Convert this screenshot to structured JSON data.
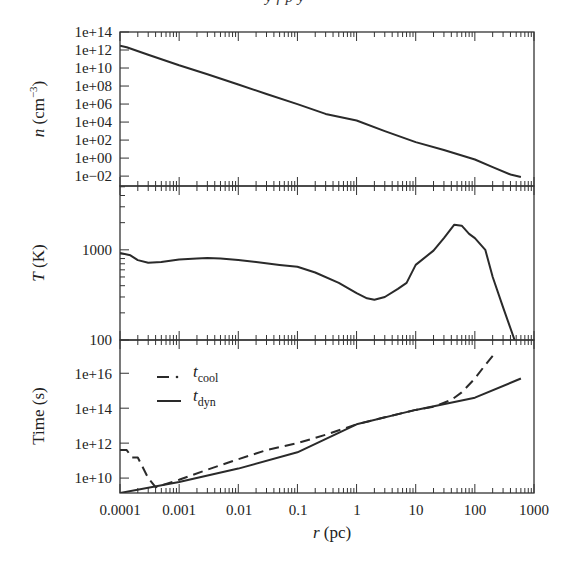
{
  "header": {
    "clipped_text": "y f p y"
  },
  "layout": {
    "plot_left": 120,
    "plot_right": 534,
    "panels": [
      {
        "id": "density",
        "top": 32,
        "bottom": 186
      },
      {
        "id": "temperature",
        "top": 186,
        "bottom": 340
      },
      {
        "id": "time",
        "top": 340,
        "bottom": 493
      }
    ]
  },
  "colors": {
    "line": "#2a2a2a",
    "axis": "#333333",
    "background": "#ffffff"
  },
  "chart_data": [
    {
      "type": "line",
      "title": "",
      "xlabel": "r (pc)",
      "ylabel": "n (cm^-3)",
      "xscale": "log",
      "yscale": "log",
      "xlim": [
        0.0001,
        1000
      ],
      "ylim": [
        0.0008,
        100000000000000.0
      ],
      "ytick_labels": [
        "1e+14",
        "1e+12",
        "1e+10",
        "1e+08",
        "1e+06",
        "1e+04",
        "1e+02",
        "1e+00",
        "1e-02"
      ],
      "ytick_values": [
        100000000000000.0,
        1000000000000.0,
        10000000000.0,
        100000000.0,
        1000000.0,
        10000.0,
        100.0,
        1,
        0.01
      ],
      "grid": false,
      "series": [
        {
          "name": "n",
          "style": "solid",
          "x": [
            0.0001,
            0.00013,
            0.0003,
            0.001,
            0.003,
            0.01,
            0.03,
            0.1,
            0.3,
            1,
            3,
            10,
            30,
            100,
            200,
            400,
            600
          ],
          "y": [
            3000000000000.0,
            2000000000000.0,
            300000000000.0,
            20000000000.0,
            2000000000.0,
            150000000.0,
            13000000.0,
            1000000.0,
            80000.0,
            15000.0,
            1000.0,
            60,
            8,
            0.7,
            0.1,
            0.015,
            0.008
          ]
        }
      ]
    },
    {
      "type": "line",
      "xlabel": "r (pc)",
      "ylabel": "T (K)",
      "xscale": "log",
      "yscale": "log",
      "xlim": [
        0.0001,
        1000
      ],
      "ylim": [
        100,
        5100
      ],
      "ytick_labels": [
        "1000",
        "100"
      ],
      "ytick_values": [
        1000,
        100
      ],
      "grid": false,
      "series": [
        {
          "name": "T",
          "style": "solid",
          "x": [
            0.0001,
            0.00015,
            0.0002,
            0.0003,
            0.0005,
            0.001,
            0.002,
            0.003,
            0.005,
            0.01,
            0.02,
            0.05,
            0.1,
            0.2,
            0.5,
            1,
            1.5,
            2,
            3,
            5,
            7,
            10,
            20,
            30,
            45,
            60,
            80,
            100,
            150,
            200,
            300,
            470
          ],
          "y": [
            920,
            870,
            770,
            720,
            730,
            780,
            800,
            810,
            800,
            770,
            730,
            680,
            650,
            560,
            430,
            330,
            290,
            280,
            300,
            370,
            430,
            680,
            980,
            1350,
            1900,
            1850,
            1500,
            1350,
            1000,
            500,
            230,
            100
          ]
        }
      ]
    },
    {
      "type": "line",
      "xlabel": "r (pc)",
      "ylabel": "Time (s)",
      "xscale": "log",
      "yscale": "log",
      "xlim": [
        0.0001,
        1000
      ],
      "ylim": [
        1400000000.0,
        8e+17
      ],
      "ytick_labels": [
        "1e+16",
        "1e+14",
        "1e+12",
        "1e+10"
      ],
      "ytick_values": [
        1e+16,
        100000000000000.0,
        1000000000000.0,
        10000000000.0
      ],
      "xtick_labels": [
        "0.0001",
        "0.001",
        "0.01",
        "0.1",
        "1",
        "10",
        "100",
        "1000"
      ],
      "xtick_values": [
        0.0001,
        0.001,
        0.01,
        0.1,
        1,
        10,
        100,
        1000
      ],
      "legend": {
        "position": "upper left",
        "entries": [
          {
            "label": "t",
            "subscript": "cool",
            "style": "dash-dot"
          },
          {
            "label": "t",
            "subscript": "dyn",
            "style": "solid"
          }
        ]
      },
      "grid": false,
      "series": [
        {
          "name": "t_cool",
          "style": "dashed",
          "x": [
            0.0001,
            0.00013,
            0.00016,
            0.0002,
            0.0003,
            0.0004,
            0.001,
            0.003,
            0.01,
            0.03,
            0.1,
            0.3,
            1,
            3,
            10,
            20,
            40,
            60,
            100,
            150,
            200
          ],
          "y": [
            400000000000.0,
            400000000000.0,
            150000000000.0,
            150000000000.0,
            10000000000.0,
            3000000000.0,
            8000000000.0,
            30000000000.0,
            120000000000.0,
            400000000000.0,
            1000000000000.0,
            3000000000000.0,
            12000000000000.0,
            30000000000000.0,
            80000000000000.0,
            120000000000000.0,
            300000000000000.0,
            800000000000000.0,
            5000000000000000.0,
            3e+16,
            1e+17
          ]
        },
        {
          "name": "t_dyn",
          "style": "solid",
          "x": [
            0.0001,
            0.001,
            0.01,
            0.1,
            1,
            10,
            100,
            600
          ],
          "y": [
            1400000000.0,
            6000000000.0,
            35000000000.0,
            300000000000.0,
            12000000000000.0,
            80000000000000.0,
            400000000000000.0,
            5000000000000000.0
          ]
        }
      ]
    }
  ],
  "axes": {
    "x": {
      "label_italic": "r",
      "label_rest": " (pc)",
      "ticks": [
        "0.0001",
        "0.001",
        "0.01",
        "0.1",
        "1",
        "10",
        "100",
        "1000"
      ]
    },
    "top": {
      "label_italic": "n",
      "label_rest": " (cm",
      "label_sup": "−3",
      "label_close": ")",
      "ticks": [
        "1e+14",
        "1e+12",
        "1e+10",
        "1e+08",
        "1e+06",
        "1e+04",
        "1e+02",
        "1e+00",
        "1e−02"
      ]
    },
    "middle": {
      "label_italic": "T",
      "label_rest": " (K)",
      "ticks": [
        "1000",
        "100"
      ]
    },
    "bottom": {
      "label": "Time (s)",
      "ticks": [
        "1e+16",
        "1e+14",
        "1e+12",
        "1e+10"
      ]
    }
  },
  "legend": {
    "cool": {
      "main": "t",
      "sub": "cool"
    },
    "dyn": {
      "main": "t",
      "sub": "dyn"
    }
  }
}
